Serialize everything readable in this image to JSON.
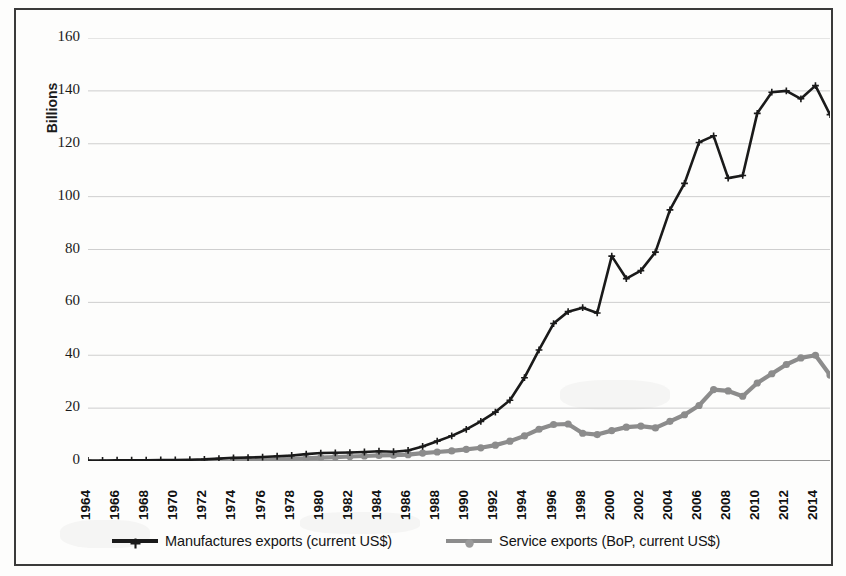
{
  "chart_data": {
    "type": "line",
    "title": "",
    "xlabel": "",
    "ylabel": "Billions",
    "ylim": [
      0,
      160
    ],
    "ytick_step": 20,
    "yticks": [
      0,
      20,
      40,
      60,
      80,
      100,
      120,
      140,
      160
    ],
    "xlim": [
      1964,
      2015
    ],
    "xtick_labels": [
      "1964",
      "1966",
      "1968",
      "1970",
      "1972",
      "1974",
      "1976",
      "1978",
      "1980",
      "1982",
      "1984",
      "1986",
      "1988",
      "1990",
      "1992",
      "1994",
      "1996",
      "1998",
      "2000",
      "2002",
      "2004",
      "2006",
      "2008",
      "2010",
      "2012",
      "2014"
    ],
    "grid": "horizontal",
    "legend_position": "bottom",
    "x": [
      1964,
      1965,
      1966,
      1967,
      1968,
      1969,
      1970,
      1971,
      1972,
      1973,
      1974,
      1975,
      1976,
      1977,
      1978,
      1979,
      1980,
      1981,
      1982,
      1983,
      1984,
      1985,
      1986,
      1987,
      1988,
      1989,
      1990,
      1991,
      1992,
      1993,
      1994,
      1995,
      1996,
      1997,
      1998,
      1999,
      2000,
      2001,
      2002,
      2003,
      2004,
      2005,
      2006,
      2007,
      2008,
      2009,
      2010,
      2011,
      2012,
      2013,
      2014,
      2015
    ],
    "series": [
      {
        "name": "Manufactures exports  (current US$)",
        "color": "#1a1a1a",
        "marker": "plus",
        "values": [
          0.2,
          0.2,
          0.3,
          0.3,
          0.3,
          0.4,
          0.4,
          0.5,
          0.6,
          0.9,
          1.2,
          1.3,
          1.5,
          1.8,
          2.1,
          2.6,
          3.0,
          3.1,
          3.2,
          3.4,
          3.7,
          3.5,
          4.0,
          5.5,
          7.5,
          9.5,
          12.0,
          15.0,
          18.5,
          23.0,
          31.5,
          42.0,
          52.0,
          56.5,
          58.0,
          56.0,
          77.5,
          69.0,
          72.0,
          79.0,
          95.0,
          105.0,
          120.5,
          123.0,
          107.0,
          108.0,
          131.5,
          139.5,
          140.0,
          137.0,
          142.0,
          131.0
        ]
      },
      {
        "name": "Service exports (BoP, current US$)",
        "color": "#8c8c8c",
        "marker": "circle",
        "values": [
          null,
          null,
          null,
          null,
          null,
          null,
          null,
          null,
          null,
          null,
          0.3,
          0.4,
          0.5,
          0.6,
          0.8,
          1.0,
          1.3,
          1.5,
          1.7,
          1.9,
          2.1,
          2.2,
          2.4,
          3.0,
          3.4,
          3.8,
          4.4,
          5.0,
          6.0,
          7.5,
          9.5,
          12.0,
          13.8,
          14.0,
          10.5,
          10.0,
          11.5,
          12.8,
          13.2,
          12.5,
          15.0,
          17.5,
          21.0,
          27.0,
          26.5,
          24.5,
          29.5,
          33.0,
          36.5,
          39.0,
          40.0,
          32.5
        ]
      }
    ]
  },
  "axis": {
    "y_title": "Billions",
    "y_labels": [
      "160",
      "140",
      "120",
      "100",
      "80",
      "60",
      "40",
      "20",
      "0"
    ],
    "x_labels": [
      "1964",
      "1966",
      "1968",
      "1970",
      "1972",
      "1974",
      "1976",
      "1978",
      "1980",
      "1982",
      "1984",
      "1986",
      "1988",
      "1990",
      "1992",
      "1994",
      "1996",
      "1998",
      "2000",
      "2002",
      "2004",
      "2006",
      "2008",
      "2010",
      "2012",
      "2014"
    ]
  },
  "legend": {
    "items": [
      {
        "label": "Manufactures exports  (current US$)",
        "color": "#1a1a1a",
        "marker": "plus-marker"
      },
      {
        "label": "Service exports (BoP, current US$)",
        "color": "#8c8c8c",
        "marker": "circle-marker"
      }
    ]
  },
  "colors": {
    "manufactures": "#1a1a1a",
    "services": "#8c8c8c",
    "grid": "#b9b9b9",
    "frame": "#3a3a3a",
    "background": "#fdfdfc"
  }
}
